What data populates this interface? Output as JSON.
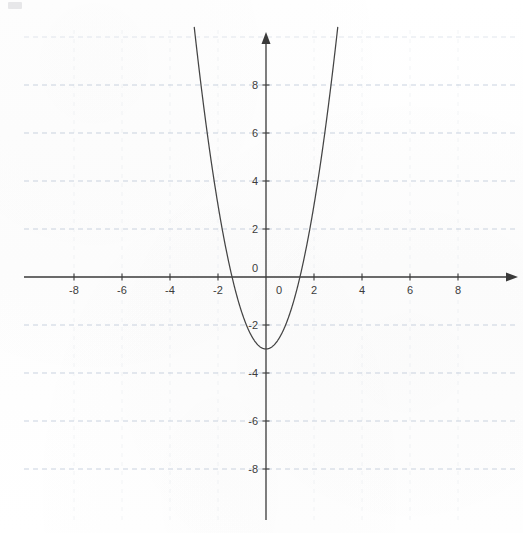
{
  "chart_data": {
    "type": "line",
    "title": "",
    "subtitle": "",
    "xlabel": "",
    "ylabel": "",
    "xlim": [
      -9.8,
      9.8
    ],
    "ylim": [
      -10.1,
      10.3
    ],
    "grid": true,
    "grid_style": "dashed",
    "grid_color": "#b9c4d6",
    "legend": false,
    "legend_position": "none",
    "axis_color": "#3a3a3a",
    "curve_color": "#444444",
    "background_color": "#fefefe",
    "axes": {
      "x_axis_arrow": true,
      "y_axis_arrow": true,
      "origin_label": "0",
      "x_ticks": [
        -8,
        -6,
        -4,
        -2,
        2,
        4,
        6,
        8
      ],
      "x_tick_labels": [
        "-8",
        "-6",
        "-4",
        "-2",
        "2",
        "4",
        "6",
        "8"
      ],
      "y_ticks": [
        8,
        6,
        4,
        2,
        -2,
        -4,
        -6,
        -8
      ],
      "y_tick_labels": [
        "8",
        "6",
        "4",
        "2",
        "-2",
        "-4",
        "-6",
        "-8"
      ],
      "x_tick_step": 2,
      "y_tick_step": 2
    },
    "series": [
      {
        "name": "parabola",
        "equation": "y = 1.5x^2 - 3",
        "coefficients": {
          "a": 1.5,
          "b": 0,
          "c": -3
        },
        "vertex": [
          0,
          -3
        ],
        "roots": [
          -1.414,
          1.414
        ],
        "y_intercept": -3,
        "opens": "up",
        "x": [
          -2.65,
          -2.4,
          -2.2,
          -2.0,
          -1.8,
          -1.6,
          -1.414,
          -1.2,
          -1.0,
          -0.8,
          -0.6,
          -0.4,
          -0.2,
          0,
          0.2,
          0.4,
          0.6,
          0.8,
          1.0,
          1.2,
          1.414,
          1.6,
          1.8,
          2.0,
          2.2,
          2.4,
          2.65
        ],
        "values": [
          7.54,
          5.64,
          4.26,
          3.0,
          1.86,
          0.84,
          0,
          -0.84,
          -1.5,
          -2.04,
          -2.46,
          -2.76,
          -2.94,
          -3.0,
          -2.94,
          -2.76,
          -2.46,
          -2.04,
          -1.5,
          -0.84,
          0,
          0.84,
          1.86,
          3.0,
          4.26,
          5.64,
          7.54
        ]
      }
    ]
  },
  "figure": {
    "corner_mark": "scan-artifact"
  }
}
